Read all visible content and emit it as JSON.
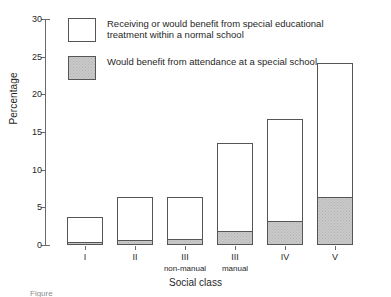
{
  "chart_data": {
    "type": "bar",
    "stacked": true,
    "title": "",
    "xlabel": "Social class",
    "ylabel": "Percentage",
    "ylim": [
      0,
      30
    ],
    "ytick_labels": [
      "0",
      "5",
      "10",
      "15",
      "20",
      "25",
      "30"
    ],
    "ytick_values": [
      0,
      5,
      10,
      15,
      20,
      25,
      30
    ],
    "grid": false,
    "legend_position": "upper-left-inside",
    "categories": [
      "I",
      "II",
      "III",
      "III",
      "IV",
      "V"
    ],
    "category_sublabels": [
      "",
      "",
      "non-manual",
      "manual",
      "",
      ""
    ],
    "series": [
      {
        "name": "Receiving or would benefit from special educational treatment within a normal school",
        "values": [
          3.7,
          6.4,
          6.4,
          13.6,
          16.7,
          24.1
        ],
        "note": "values are cumulative bar totals",
        "color": "#ffffff"
      },
      {
        "name": "Would benefit from attendance at a special school",
        "values": [
          0.3,
          0.5,
          0.6,
          1.7,
          3.0,
          6.2
        ],
        "color": "#c9c9c9"
      }
    ]
  },
  "axes": {
    "y_title": "Percentage",
    "x_title": "Social class"
  },
  "legend": {
    "items": [
      {
        "swatch": "open",
        "label": "Receiving or would benefit from special educational\ntreatment within a normal school"
      },
      {
        "swatch": "shaded",
        "label": "Would benefit from attendance at a special school"
      }
    ]
  },
  "caption": "Figure"
}
